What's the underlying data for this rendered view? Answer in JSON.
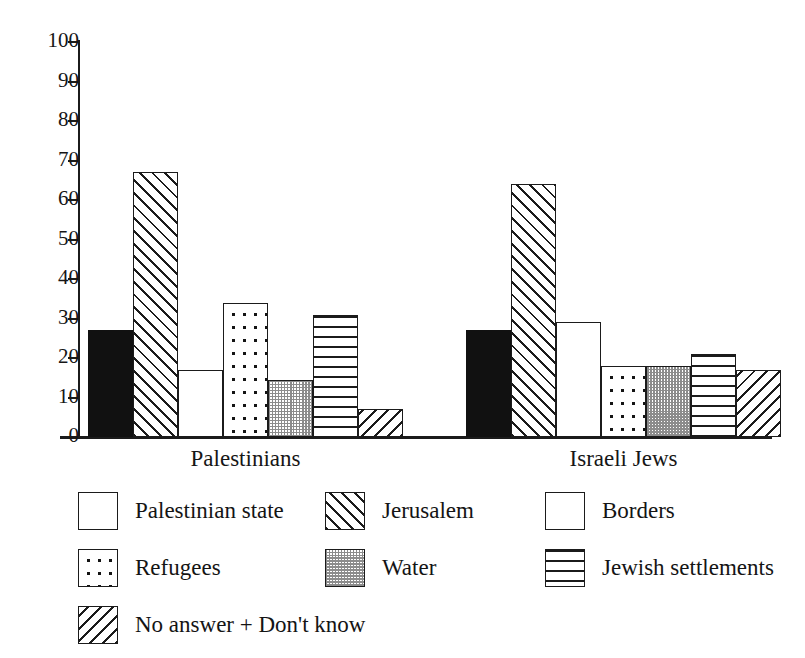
{
  "chart_data": {
    "type": "bar",
    "title": "",
    "xlabel": "",
    "ylabel": "",
    "ylim": [
      0,
      100
    ],
    "ytick_step": 10,
    "yticks": [
      100,
      90,
      80,
      70,
      60,
      50,
      40,
      30,
      20,
      10,
      0
    ],
    "grid": false,
    "legend_position": "bottom",
    "categories": [
      "Palestinians",
      "Israeli Jews"
    ],
    "series": [
      {
        "name": "Palestinian state",
        "pattern": "solid",
        "values": [
          27,
          27
        ]
      },
      {
        "name": "Jerusalem",
        "pattern": "fhatch",
        "values": [
          67,
          64
        ]
      },
      {
        "name": "Borders",
        "pattern": "empty",
        "values": [
          17,
          29
        ]
      },
      {
        "name": "Refugees",
        "pattern": "dots",
        "values": [
          34,
          18
        ]
      },
      {
        "name": "Water",
        "pattern": "checker",
        "values": [
          14.5,
          18
        ]
      },
      {
        "name": "Jewish settlements",
        "pattern": "hlines",
        "values": [
          31,
          21
        ]
      },
      {
        "name": "No answer + Don't know",
        "pattern": "bhatch",
        "values": [
          7,
          17
        ]
      }
    ]
  },
  "axis": {
    "tick_labels": [
      "100",
      "90",
      "80",
      "70",
      "60",
      "50",
      "40",
      "30",
      "20",
      "10",
      "0"
    ]
  },
  "categories": [
    {
      "label": "Palestinians"
    },
    {
      "label": "Israeli Jews"
    }
  ],
  "legend": {
    "items": [
      {
        "label": "Palestinian state",
        "pattern": "solid"
      },
      {
        "label": "Jerusalem",
        "pattern": "fhatch"
      },
      {
        "label": "Borders",
        "pattern": "empty"
      },
      {
        "label": "Refugees",
        "pattern": "dots"
      },
      {
        "label": "Water",
        "pattern": "checker"
      },
      {
        "label": "Jewish settlements",
        "pattern": "hlines"
      },
      {
        "label": "No answer + Don't know",
        "pattern": "bhatch"
      }
    ]
  },
  "colors": {
    "ink": "#1b1b1b",
    "background": "#ffffff",
    "water_gray": "#8c8c8c"
  }
}
